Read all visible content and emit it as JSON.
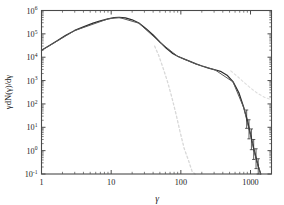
{
  "chart_data": {
    "type": "line",
    "title": "",
    "xlabel": "γ",
    "ylabel": "γdN(γ)/dγ",
    "xscale": "log",
    "yscale": "log",
    "xlim": [
      1,
      2000
    ],
    "ylim": [
      0.1,
      1000000
    ],
    "grid": false,
    "legend": "none",
    "xticks": [
      1,
      10,
      100,
      1000
    ],
    "xticklabels": [
      "1",
      "10",
      "100",
      "1000"
    ],
    "yticks": [
      0.1,
      1,
      10,
      100,
      1000,
      10000,
      100000,
      1000000
    ],
    "yticklabels": [
      "10⁻¹",
      "10⁰",
      "10¹",
      "10²",
      "10³",
      "10⁴",
      "10⁵",
      "10⁶"
    ],
    "series": [
      {
        "name": "total spectrum (solid dark)",
        "style": "solid",
        "color": "#2b2b2b",
        "x": [
          1.0,
          1.3,
          1.7,
          2.2,
          3.0,
          4.0,
          5.5,
          7.0,
          9.0,
          11.0,
          13.0,
          16.0,
          20.0,
          25.0,
          32.0,
          40.0,
          50.0,
          62.0,
          75.0,
          90.0,
          110.0,
          135.0,
          165.0,
          200.0,
          250.0,
          310.0,
          380.0,
          460.0,
          560.0,
          680.0,
          800.0,
          900.0,
          1000.0,
          1100.0,
          1200.0,
          1300.0,
          1400.0
        ],
        "y": [
          20000.0,
          32000.0,
          52000.0,
          85000.0,
          140000.0,
          200000.0,
          290000.0,
          360000.0,
          440000.0,
          490000.0,
          510000.0,
          480000.0,
          400000.0,
          290000.0,
          160000.0,
          90000.0,
          45000.0,
          24000.0,
          15000.0,
          11000.0,
          8500.0,
          6600.0,
          5200.0,
          4200.0,
          3400.0,
          2900.0,
          2400.0,
          1700.0,
          900.0,
          300.0,
          70.0,
          20.0,
          5.0,
          1.4,
          0.5,
          0.2,
          0.1
        ]
      },
      {
        "name": "secondary fit (solid grey)",
        "style": "solid",
        "color": "#5a5a5a",
        "x": [
          1.0,
          3.0,
          9.0,
          13.0,
          25.0,
          50.0,
          90.0,
          165.0,
          310.0,
          560.0,
          800.0,
          1000.0,
          1200.0,
          1400.0
        ],
        "y": [
          19500.0,
          138000.0,
          435000.0,
          505000.0,
          285000.0,
          44000.0,
          10800.0,
          5100.0,
          2850.0,
          880.0,
          68.0,
          4.6,
          0.45,
          0.1
        ]
      },
      {
        "name": "thermal component (dashed light)",
        "style": "dashed",
        "color": "#d8d8d8",
        "x": [
          42.0,
          48.0,
          55.0,
          64.0,
          74.0,
          85.0,
          98.0,
          112.0,
          128.0,
          145.0,
          160.0
        ],
        "y": [
          30000.0,
          12000.0,
          3800.0,
          950.0,
          200.0,
          38.0,
          6.0,
          1.2,
          0.4,
          0.13,
          0.1
        ]
      },
      {
        "name": "power-law tail (dashed light)",
        "style": "dashed",
        "color": "#dedede",
        "x": [
          520.0,
          650.0,
          800.0,
          1000.0,
          1250.0,
          1600.0,
          2000.0
        ],
        "y": [
          2600.0,
          1500.0,
          850.0,
          480.0,
          290.0,
          190.0,
          150.0
        ]
      }
    ],
    "errorbars": {
      "name": "high-energy bins with uncertainties",
      "x": [
        880.0,
        950.0,
        1030.0,
        1110.0,
        1200.0,
        1290.0
      ],
      "y": [
        22.0,
        8.0,
        3.0,
        1.1,
        0.45,
        0.2
      ],
      "y_lo": [
        9.0,
        3.2,
        1.1,
        0.42,
        0.17,
        0.1
      ],
      "y_hi": [
        55.0,
        21.0,
        8.5,
        3.0,
        1.2,
        0.45
      ]
    }
  }
}
